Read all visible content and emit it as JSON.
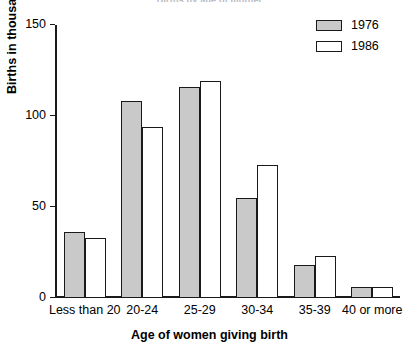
{
  "chart_data": {
    "type": "bar",
    "title": "Births by age of mother",
    "xlabel": "Age of women giving birth",
    "ylabel": "Births in thousands",
    "categories": [
      "Less than 20",
      "20-24",
      "25-29",
      "30-34",
      "35-39",
      "40 or more"
    ],
    "series": [
      {
        "name": "1976",
        "color": "#c9c9c9",
        "values": [
          36,
          108,
          116,
          55,
          18,
          6
        ]
      },
      {
        "name": "1986",
        "color": "#ffffff",
        "values": [
          33,
          94,
          119,
          73,
          23,
          6
        ]
      }
    ],
    "ylim": [
      0,
      150
    ],
    "yticks": [
      0,
      50,
      100,
      150
    ],
    "ytick_labels": [
      "0",
      "50",
      "100",
      "150"
    ],
    "grid": false,
    "legend_position": "top-right"
  }
}
